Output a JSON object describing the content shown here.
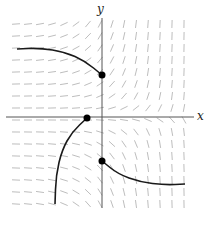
{
  "figure": {
    "type": "slope-field",
    "axes": {
      "x_label": "x",
      "y_label": "y",
      "origin_px": [
        102,
        117
      ],
      "color": "#555555"
    },
    "field": {
      "x_range_px": [
        16,
        186
      ],
      "y_range_px": [
        24,
        204
      ],
      "spacing_px": 12,
      "segment_length_px": 8,
      "color": "#b5b5b5",
      "description": "Slopes nearly horizontal in upper-left and lower-right quadrants; nearly vertical in upper-right and lower-left quadrants"
    },
    "solution_curves": [
      {
        "name": "upper-left-curve",
        "points_px": [
          [
            17,
            49
          ],
          [
            40,
            48
          ],
          [
            65,
            52
          ],
          [
            85,
            61
          ],
          [
            102,
            75
          ]
        ],
        "initial_point_px": [
          102,
          75
        ]
      },
      {
        "name": "lower-left-curve",
        "points_px": [
          [
            87,
            118
          ],
          [
            72,
            132
          ],
          [
            62,
            150
          ],
          [
            56,
            175
          ],
          [
            55,
            204
          ]
        ],
        "initial_point_px": [
          87,
          118
        ]
      },
      {
        "name": "lower-right-curve",
        "points_px": [
          [
            102,
            161
          ],
          [
            118,
            174
          ],
          [
            140,
            182
          ],
          [
            165,
            185
          ],
          [
            185,
            184
          ]
        ],
        "initial_point_px": [
          102,
          161
        ]
      }
    ],
    "curve_color": "#1a1a1a",
    "point_color": "#000000"
  }
}
